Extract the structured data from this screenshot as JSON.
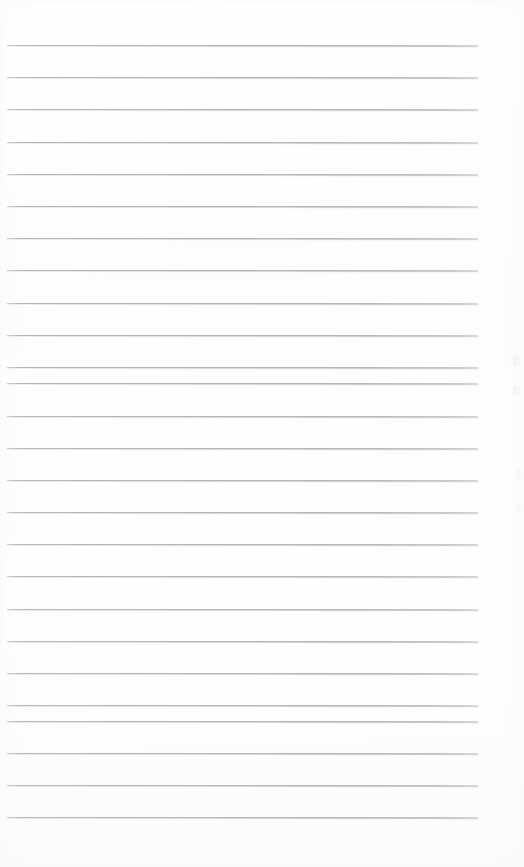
{
  "document": {
    "kind": "scanned-lined-notebook-page",
    "title": "Blank ruled notebook page",
    "page_width": 524,
    "page_height": 867,
    "content_text": "",
    "is_blank": true,
    "handwriting_present": false,
    "printed_text_present": false
  },
  "paper": {
    "background_color": "#fefefe",
    "tint_color": "#fcfcfc",
    "texture": "faint-scanner-grain"
  },
  "ruling": {
    "style": "horizontal-ruled",
    "line_color": "#b2b4b7",
    "line_thickness_px": 1,
    "line_count": 25,
    "line_left_px": 7,
    "line_right_px": 478,
    "line_length_px": 471,
    "first_line_y_px": 45,
    "line_spacing_px": 32.2,
    "has_margin_rule": false,
    "has_header_rule": false,
    "lines_y_px": [
      45,
      77,
      109,
      142,
      174,
      206,
      238,
      270,
      303,
      335,
      367,
      383,
      416,
      448,
      480,
      512,
      544,
      576,
      609,
      641,
      673,
      705,
      721,
      753,
      785,
      817
    ],
    "line_slope_note": "very slight downward tilt to the right from scan skew"
  },
  "artifacts": {
    "label": "faint scanner speckles near right edge",
    "items": [
      {
        "x": 513,
        "y": 355,
        "w": 7,
        "h": 12
      },
      {
        "x": 513,
        "y": 385,
        "w": 7,
        "h": 10
      },
      {
        "x": 516,
        "y": 470,
        "w": 5,
        "h": 9
      },
      {
        "x": 516,
        "y": 505,
        "w": 5,
        "h": 8
      }
    ]
  }
}
